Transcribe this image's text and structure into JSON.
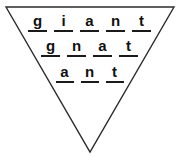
{
  "figure": {
    "name": "word-ladder-triangle",
    "shape": "inverted-triangle",
    "outline_color": "#2b2b2b",
    "background_color": "#ffffff",
    "text_color": "#111111",
    "rule_color": "#1a1a1a"
  },
  "rows": [
    {
      "word": "giant",
      "letters": [
        "g",
        "i",
        "a",
        "n",
        "t"
      ]
    },
    {
      "word": "gnat",
      "letters": [
        "g",
        "n",
        "a",
        "t"
      ]
    },
    {
      "word": "ant",
      "letters": [
        "a",
        "n",
        "t"
      ]
    }
  ]
}
